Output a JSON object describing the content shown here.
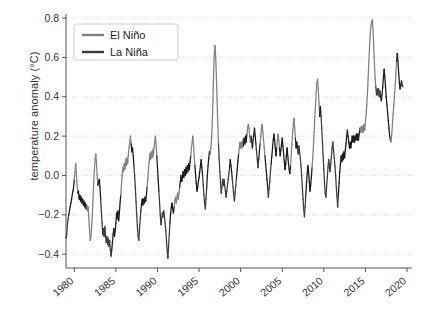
{
  "chart_data": {
    "type": "line",
    "title": "",
    "xlabel": "",
    "ylabel": "temperature anomaly (°C)",
    "xlim": [
      1979.0,
      2020.6
    ],
    "ylim": [
      -0.47,
      0.8
    ],
    "yticks": [
      -0.4,
      -0.2,
      0.0,
      0.2,
      0.4,
      0.6,
      0.8
    ],
    "ytick_labels": [
      "−0.4",
      "−0.2",
      "0.0",
      "0.2",
      "0.4",
      "0.6",
      "0.8"
    ],
    "xticks": [
      1980,
      1985,
      1990,
      1995,
      2000,
      2005,
      2010,
      2015,
      2020
    ],
    "xtick_labels": [
      "1980",
      "1985",
      "1990",
      "1995",
      "2000",
      "2005",
      "2010",
      "2015",
      "2020"
    ],
    "xtick_rotation": -40,
    "grid": "y-axis dotted light gray",
    "legend": {
      "position": "upper left",
      "entries": [
        {
          "name": "El Niño",
          "color": "#808080"
        },
        {
          "name": "La Niña",
          "color": "#3c3c3c"
        }
      ]
    },
    "series": [
      {
        "name": "temperature anomaly",
        "note": "monthly values 1979-01 .. 2020-07; segment color keyed to ENSO phase",
        "x_start": 1979.0,
        "x_step": 0.08333,
        "values": [
          -0.32,
          -0.3,
          -0.25,
          -0.22,
          -0.2,
          -0.18,
          -0.16,
          -0.14,
          -0.12,
          -0.1,
          -0.08,
          -0.06,
          -0.02,
          0.02,
          0.06,
          0.01,
          -0.05,
          -0.09,
          -0.08,
          -0.12,
          -0.1,
          -0.13,
          -0.11,
          -0.14,
          -0.12,
          -0.15,
          -0.13,
          -0.16,
          -0.14,
          -0.17,
          -0.15,
          -0.18,
          -0.16,
          -0.22,
          -0.28,
          -0.33,
          -0.31,
          -0.26,
          -0.2,
          -0.12,
          -0.04,
          0.03,
          0.08,
          0.11,
          0.06,
          0.0,
          -0.05,
          -0.03,
          -0.02,
          -0.06,
          -0.12,
          -0.18,
          -0.24,
          -0.3,
          -0.27,
          -0.31,
          -0.26,
          -0.3,
          -0.34,
          -0.31,
          -0.35,
          -0.32,
          -0.36,
          -0.33,
          -0.38,
          -0.41,
          -0.38,
          -0.34,
          -0.3,
          -0.27,
          -0.31,
          -0.28,
          -0.24,
          -0.19,
          -0.22,
          -0.18,
          -0.23,
          -0.19,
          -0.14,
          -0.1,
          -0.05,
          0.0,
          0.04,
          0.02,
          0.06,
          0.03,
          0.08,
          0.05,
          0.09,
          0.06,
          0.11,
          0.14,
          0.17,
          0.2,
          0.16,
          0.12,
          0.14,
          0.1,
          0.05,
          0.0,
          -0.06,
          -0.13,
          -0.2,
          -0.26,
          -0.31,
          -0.33,
          -0.28,
          -0.22,
          -0.18,
          -0.14,
          -0.12,
          -0.15,
          -0.12,
          -0.14,
          -0.11,
          -0.13,
          -0.1,
          -0.06,
          -0.02,
          0.03,
          0.07,
          0.11,
          0.08,
          0.12,
          0.09,
          0.13,
          0.1,
          0.14,
          0.17,
          0.2,
          0.16,
          0.1,
          0.04,
          -0.02,
          -0.08,
          -0.14,
          -0.2,
          -0.25,
          -0.22,
          -0.19,
          -0.21,
          -0.18,
          -0.21,
          -0.24,
          -0.28,
          -0.33,
          -0.38,
          -0.42,
          -0.36,
          -0.3,
          -0.24,
          -0.19,
          -0.16,
          -0.14,
          -0.17,
          -0.19,
          -0.16,
          -0.13,
          -0.11,
          -0.14,
          -0.11,
          -0.09,
          -0.12,
          -0.09,
          -0.06,
          -0.03,
          0.0,
          -0.03,
          -0.01,
          0.02,
          -0.01,
          0.03,
          0.0,
          0.04,
          0.01,
          0.05,
          0.02,
          0.06,
          0.03,
          0.07,
          0.1,
          0.14,
          0.17,
          0.2,
          0.15,
          0.1,
          0.05,
          0.0,
          -0.04,
          -0.08,
          -0.06,
          -0.03,
          -0.01,
          0.02,
          0.05,
          0.08,
          0.04,
          0.0,
          -0.05,
          -0.1,
          -0.14,
          -0.17,
          -0.12,
          -0.06,
          0.0,
          0.05,
          0.09,
          0.12,
          0.11,
          0.14,
          0.18,
          0.26,
          0.38,
          0.52,
          0.62,
          0.66,
          0.6,
          0.5,
          0.38,
          0.26,
          0.16,
          0.08,
          0.02,
          -0.04,
          -0.09,
          -0.06,
          -0.02,
          -0.05,
          -0.02,
          -0.05,
          -0.08,
          -0.11,
          -0.08,
          -0.05,
          -0.02,
          0.01,
          0.04,
          0.08,
          0.05,
          0.02,
          -0.02,
          -0.06,
          -0.1,
          -0.13,
          -0.09,
          -0.05,
          -0.01,
          0.03,
          0.07,
          0.11,
          0.14,
          0.17,
          0.14,
          0.17,
          0.14,
          0.18,
          0.15,
          0.19,
          0.16,
          0.2,
          0.17,
          0.21,
          0.24,
          0.26,
          0.24,
          0.2,
          0.17,
          0.2,
          0.17,
          0.14,
          0.18,
          0.21,
          0.24,
          0.2,
          0.16,
          0.12,
          0.08,
          0.04,
          0.08,
          0.12,
          0.16,
          0.2,
          0.24,
          0.26,
          0.22,
          0.18,
          0.14,
          0.1,
          0.06,
          0.02,
          -0.02,
          -0.06,
          -0.11,
          -0.07,
          -0.03,
          0.02,
          0.06,
          0.1,
          0.14,
          0.18,
          0.21,
          0.18,
          0.14,
          0.1,
          0.14,
          0.18,
          0.21,
          0.18,
          0.14,
          0.1,
          0.13,
          0.16,
          0.19,
          0.15,
          0.11,
          0.07,
          0.03,
          0.06,
          0.1,
          0.14,
          0.1,
          0.06,
          0.03,
          0.01,
          0.05,
          0.1,
          0.16,
          0.22,
          0.26,
          0.29,
          0.24,
          0.19,
          0.14,
          0.17,
          0.14,
          0.11,
          0.15,
          0.12,
          0.09,
          0.05,
          0.0,
          -0.06,
          -0.12,
          -0.17,
          -0.21,
          -0.16,
          -0.1,
          -0.04,
          0.01,
          0.05,
          0.02,
          -0.03,
          -0.08,
          -0.05,
          -0.01,
          0.04,
          0.09,
          0.15,
          0.22,
          0.3,
          0.36,
          0.42,
          0.47,
          0.49,
          0.44,
          0.37,
          0.3,
          0.35,
          0.3,
          0.24,
          0.17,
          0.1,
          0.03,
          -0.04,
          -0.09,
          -0.11,
          -0.06,
          -0.01,
          0.04,
          0.08,
          0.05,
          0.02,
          0.06,
          0.1,
          0.14,
          0.17,
          0.13,
          0.09,
          0.05,
          0.0,
          -0.06,
          -0.11,
          -0.16,
          -0.1,
          -0.04,
          0.02,
          0.06,
          0.1,
          0.07,
          0.11,
          0.08,
          0.12,
          0.09,
          0.13,
          0.16,
          0.2,
          0.23,
          0.2,
          0.17,
          0.14,
          0.17,
          0.14,
          0.17,
          0.2,
          0.17,
          0.2,
          0.17,
          0.2,
          0.18,
          0.21,
          0.18,
          0.21,
          0.18,
          0.21,
          0.24,
          0.22,
          0.25,
          0.22,
          0.25,
          0.22,
          0.26,
          0.23,
          0.27,
          0.31,
          0.36,
          0.42,
          0.5,
          0.58,
          0.66,
          0.72,
          0.76,
          0.78,
          0.79,
          0.74,
          0.66,
          0.57,
          0.5,
          0.45,
          0.41,
          0.44,
          0.41,
          0.44,
          0.4,
          0.43,
          0.4,
          0.38,
          0.41,
          0.45,
          0.5,
          0.54,
          0.5,
          0.45,
          0.4,
          0.36,
          0.32,
          0.28,
          0.24,
          0.2,
          0.18,
          0.17,
          0.21,
          0.26,
          0.31,
          0.36,
          0.41,
          0.46,
          0.52,
          0.58,
          0.62,
          0.58,
          0.52,
          0.47,
          0.44,
          0.46,
          0.48,
          0.46,
          0.45
        ],
        "phase": [
          "nina",
          "nina",
          "nina",
          "nina",
          "neutral",
          "neutral",
          "neutral",
          "neutral",
          "neutral",
          "neutral",
          "neutral",
          "neutral",
          "nino",
          "nino",
          "nino",
          "nino",
          "nino",
          "neutral",
          "neutral",
          "neutral",
          "neutral",
          "neutral",
          "neutral",
          "neutral",
          "neutral",
          "neutral",
          "neutral",
          "neutral",
          "neutral",
          "neutral",
          "nino",
          "nino",
          "nino",
          "nino",
          "nino",
          "nino",
          "nino",
          "nino",
          "nino",
          "nino",
          "nino",
          "nino",
          "nino",
          "nino",
          "nino",
          "nino",
          "neutral",
          "neutral",
          "neutral",
          "neutral",
          "nina",
          "nina",
          "nina",
          "nina",
          "nina",
          "nina",
          "nina",
          "nina",
          "nina",
          "nina",
          "nina",
          "nina",
          "nina",
          "nina",
          "nina",
          "nina",
          "neutral",
          "neutral",
          "neutral",
          "neutral",
          "neutral",
          "neutral",
          "neutral",
          "neutral",
          "neutral",
          "neutral",
          "neutral",
          "neutral",
          "neutral",
          "nino",
          "nino",
          "nino",
          "nino",
          "nino",
          "nino",
          "nino",
          "nino",
          "nino",
          "nino",
          "nino",
          "nino",
          "nino",
          "nino",
          "nino",
          "neutral",
          "neutral",
          "neutral",
          "neutral",
          "nina",
          "nina",
          "nina",
          "nina",
          "nina",
          "nina",
          "nina",
          "nina",
          "nina",
          "nina",
          "neutral",
          "neutral",
          "neutral",
          "neutral",
          "neutral",
          "neutral",
          "neutral",
          "neutral",
          "neutral",
          "nino",
          "nino",
          "nino",
          "nino",
          "nino",
          "nino",
          "nino",
          "nino",
          "nino",
          "nino",
          "nino",
          "nino",
          "nino",
          "nino",
          "neutral",
          "neutral",
          "neutral",
          "nina",
          "nina",
          "nina",
          "nina",
          "nina",
          "nina",
          "nina",
          "nina",
          "nina",
          "nina",
          "nina",
          "nina",
          "nina",
          "nina",
          "nina",
          "nina",
          "neutral",
          "neutral",
          "neutral",
          "neutral",
          "neutral",
          "neutral",
          "nino",
          "nino",
          "nino",
          "nino",
          "nino",
          "nino",
          "nino",
          "nino",
          "neutral",
          "neutral",
          "neutral",
          "neutral",
          "neutral",
          "neutral",
          "neutral",
          "neutral",
          "neutral",
          "neutral",
          "neutral",
          "neutral",
          "neutral",
          "neutral",
          "neutral",
          "neutral",
          "nino",
          "nino",
          "nino",
          "nino",
          "nino",
          "nino",
          "neutral",
          "neutral",
          "neutral",
          "neutral",
          "neutral",
          "neutral",
          "neutral",
          "neutral",
          "neutral",
          "neutral",
          "neutral",
          "nina",
          "nina",
          "nina",
          "nina",
          "nina",
          "nina",
          "neutral",
          "neutral",
          "neutral",
          "neutral",
          "neutral",
          "nino",
          "nino",
          "nino",
          "nino",
          "nino",
          "nino",
          "nino",
          "nino",
          "nino",
          "nino",
          "nino",
          "nino",
          "nina",
          "nina",
          "nina",
          "nina",
          "nina",
          "nina",
          "nina",
          "nina",
          "nina",
          "nina",
          "nina",
          "nina",
          "nina",
          "nina",
          "nina",
          "nina",
          "neutral",
          "neutral",
          "neutral",
          "neutral",
          "nina",
          "nina",
          "nina",
          "nina",
          "nina",
          "nina",
          "neutral",
          "neutral",
          "neutral",
          "nino",
          "nino",
          "nino",
          "nino",
          "nino",
          "nino",
          "nino",
          "neutral",
          "neutral",
          "neutral",
          "neutral",
          "neutral",
          "nino",
          "nino",
          "nino",
          "nino",
          "nino",
          "nino",
          "neutral",
          "neutral",
          "neutral",
          "neutral",
          "neutral",
          "neutral",
          "neutral",
          "nina",
          "nina",
          "nina",
          "nina",
          "neutral",
          "neutral",
          "nino",
          "nino",
          "nino",
          "nino",
          "nino",
          "nino",
          "nino",
          "neutral",
          "neutral",
          "neutral",
          "neutral",
          "neutral",
          "nina",
          "nina",
          "nina",
          "nina",
          "neutral",
          "neutral",
          "neutral",
          "neutral",
          "neutral",
          "neutral",
          "neutral",
          "neutral",
          "nino",
          "nino",
          "nino",
          "nino",
          "neutral",
          "neutral",
          "neutral",
          "neutral",
          "neutral",
          "neutral",
          "neutral",
          "neutral",
          "neutral",
          "neutral",
          "neutral",
          "neutral",
          "neutral",
          "neutral",
          "neutral",
          "neutral",
          "nino",
          "nino",
          "nino",
          "nino",
          "nino",
          "nino",
          "nino",
          "neutral",
          "neutral",
          "neutral",
          "nina",
          "nina",
          "nina",
          "nina",
          "nina",
          "nina",
          "nina",
          "nina",
          "nina",
          "nina",
          "nina",
          "nina",
          "neutral",
          "neutral",
          "neutral",
          "neutral",
          "neutral",
          "neutral",
          "neutral",
          "neutral",
          "neutral",
          "nino",
          "nino",
          "nino",
          "nino",
          "nino",
          "nino",
          "nino",
          "nino",
          "nino",
          "nino",
          "nino",
          "neutral",
          "neutral",
          "nina",
          "nina",
          "nina",
          "nina",
          "nina",
          "nina",
          "nina",
          "nina",
          "nina",
          "nina",
          "nina",
          "nina",
          "nina",
          "nina",
          "nina",
          "nina",
          "nina",
          "nina",
          "nina",
          "nina",
          "nina",
          "nina",
          "nina",
          "nina",
          "nina",
          "neutral",
          "neutral",
          "neutral",
          "neutral",
          "neutral",
          "neutral",
          "neutral",
          "neutral",
          "neutral",
          "neutral",
          "neutral",
          "neutral",
          "neutral",
          "neutral",
          "neutral",
          "neutral",
          "neutral",
          "neutral",
          "neutral",
          "neutral",
          "neutral",
          "neutral",
          "neutral",
          "neutral",
          "neutral",
          "neutral",
          "neutral",
          "neutral",
          "neutral",
          "neutral",
          "neutral",
          "nino",
          "nino",
          "nino",
          "nino",
          "nino",
          "nino",
          "nino",
          "nino",
          "nino",
          "nino",
          "nino",
          "nino",
          "nino",
          "nino",
          "nino",
          "nino",
          "nino",
          "nino",
          "nino",
          "nino",
          "nino",
          "nino",
          "nino",
          "nina",
          "nina",
          "nina",
          "nina",
          "nina",
          "nina",
          "nina",
          "neutral",
          "neutral",
          "neutral",
          "neutral",
          "neutral",
          "neutral",
          "neutral",
          "neutral",
          "neutral",
          "neutral",
          "neutral",
          "neutral",
          "neutral",
          "neutral",
          "nino",
          "nino",
          "nino",
          "nino",
          "nino",
          "nino",
          "nino",
          "nino",
          "nino",
          "neutral",
          "neutral",
          "neutral",
          "neutral",
          "neutral",
          "neutral",
          "neutral",
          "neutral",
          "neutral",
          "neutral"
        ]
      }
    ]
  },
  "colors": {
    "nino": "#808080",
    "nina": "#3c3c3c",
    "neutral": "#1a1a1a",
    "grid": "#cfcfcf",
    "axis": "#555555",
    "text": "#333333",
    "background": "#ffffff",
    "legend_border": "#cccccc"
  }
}
